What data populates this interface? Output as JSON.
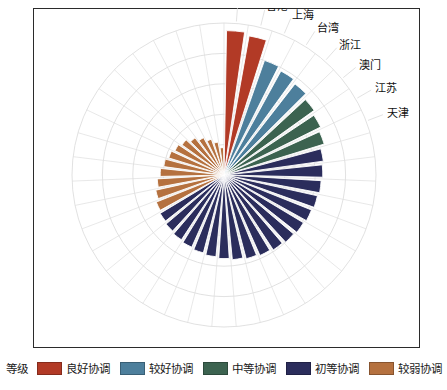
{
  "chart_data": {
    "type": "bar",
    "polar": true,
    "title": "",
    "subtitle": "",
    "xlabel": "",
    "ylabel": "",
    "grid": true,
    "legend_position": "bottom",
    "center": [
      224,
      175
    ],
    "max_radius": 180,
    "rlim": [
      0,
      1.0
    ],
    "grid_rings": [
      0.2,
      0.4,
      0.6,
      0.8,
      1.0
    ],
    "start_angle_deg": 90,
    "direction": "clockwise",
    "categories": [
      "北京",
      "香港",
      "上海",
      "台湾",
      "浙江",
      "澳门",
      "江苏",
      "天津",
      "广东",
      "福建",
      "山东",
      "辽宁",
      "重庆",
      "湖北",
      "陕西",
      "内蒙古",
      "吉林",
      "湖南",
      "四川",
      "河北",
      "黑龙江",
      "安徽",
      "江西",
      "山西",
      "海南",
      "河南",
      "宁夏",
      "新疆",
      "青海",
      "广西",
      "云南",
      "甘肃",
      "贵州",
      "西藏",
      "延边",
      "毕节",
      "临沧",
      "怒江",
      "和田"
    ],
    "values": [
      0.95,
      0.93,
      0.8,
      0.78,
      0.76,
      0.73,
      0.71,
      0.69,
      0.66,
      0.65,
      0.64,
      0.63,
      0.62,
      0.61,
      0.6,
      0.59,
      0.58,
      0.57,
      0.56,
      0.55,
      0.54,
      0.53,
      0.52,
      0.51,
      0.5,
      0.49,
      0.48,
      0.46,
      0.44,
      0.42,
      0.4,
      0.38,
      0.36,
      0.34,
      0.31,
      0.28,
      0.25,
      0.22,
      0.18
    ],
    "grades": [
      "良好协调",
      "良好协调",
      "较好协调",
      "较好协调",
      "较好协调",
      "中等协调",
      "中等协调",
      "中等协调",
      "初等协调",
      "初等协调",
      "初等协调",
      "初等协调",
      "初等协调",
      "初等协调",
      "初等协调",
      "初等协调",
      "初等协调",
      "初等协调",
      "初等协调",
      "初等协调",
      "初等协调",
      "初等协调",
      "初等协调",
      "初等协调",
      "初等协调",
      "初等协调",
      "较弱协调",
      "较弱协调",
      "较弱协调",
      "较弱协调",
      "较弱协调",
      "较弱协调",
      "较弱协调",
      "较弱协调",
      "较弱协调",
      "较弱协调",
      "较弱协调",
      "较弱协调",
      "较弱协调"
    ],
    "visible_tick_labels": [
      "北京",
      "香港",
      "上海",
      "台湾",
      "浙江",
      "澳门",
      "江苏",
      "天津"
    ],
    "grade_colors": {
      "良好协调": "#b23a26",
      "较好协调": "#4d7f9c",
      "中等协调": "#3c6350",
      "初等协调": "#2b2d5c",
      "较弱协调": "#b5713f"
    }
  },
  "legend": {
    "title": "等级",
    "items": [
      {
        "label": "良好协调",
        "color": "#b23a26"
      },
      {
        "label": "较好协调",
        "color": "#4d7f9c"
      },
      {
        "label": "中等协调",
        "color": "#3c6350"
      },
      {
        "label": "初等协调",
        "color": "#2b2d5c"
      },
      {
        "label": "较弱协调",
        "color": "#b5713f"
      }
    ]
  }
}
